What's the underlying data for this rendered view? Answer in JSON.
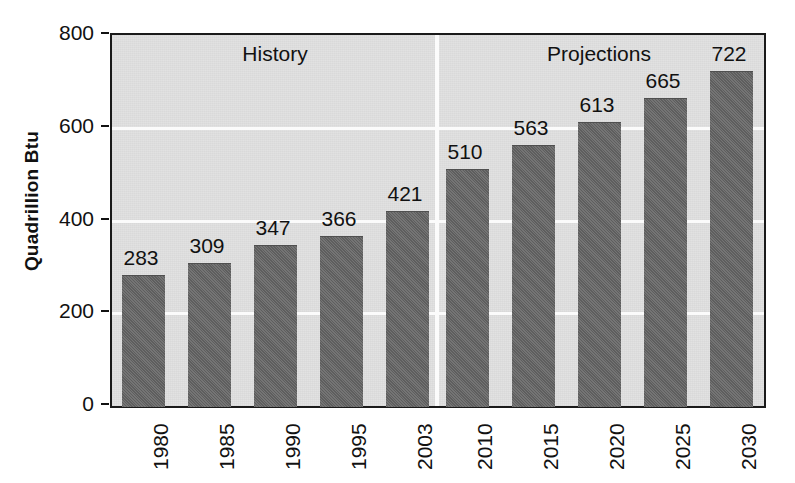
{
  "chart_data": {
    "type": "bar",
    "title": "",
    "subtitle": "",
    "xlabel": "",
    "ylabel": "Quadrillion Btu",
    "ylim": [
      0,
      800
    ],
    "ytick_labels": [
      "0",
      "200",
      "400",
      "600",
      "800"
    ],
    "ytick_values": [
      0,
      200,
      400,
      600,
      800
    ],
    "grid": "horizontal-white-gridlines-at-200-400-600",
    "legend": "none",
    "categories": [
      "1980",
      "1985",
      "1990",
      "1995",
      "2003",
      "2010",
      "2015",
      "2020",
      "2025",
      "2030"
    ],
    "values": [
      283,
      309,
      347,
      366,
      421,
      510,
      563,
      613,
      665,
      722
    ],
    "data_labels": [
      "283",
      "309",
      "347",
      "366",
      "421",
      "510",
      "563",
      "613",
      "665",
      "722"
    ],
    "bar_color": "#656565",
    "plot_background": "#e1e1e1",
    "frame_color": "#1a1a1a",
    "gridline_color": "#fbfbfb",
    "annotations": [
      {
        "text": "History",
        "section": "history",
        "spans_categories": [
          "1980",
          "1985",
          "1990",
          "1995",
          "2003"
        ]
      },
      {
        "text": "Projections",
        "section": "projections",
        "spans_categories": [
          "2010",
          "2015",
          "2020",
          "2025",
          "2030"
        ]
      }
    ],
    "divider": {
      "between": [
        "2003",
        "2010"
      ],
      "color": "#fbfbfb"
    }
  }
}
